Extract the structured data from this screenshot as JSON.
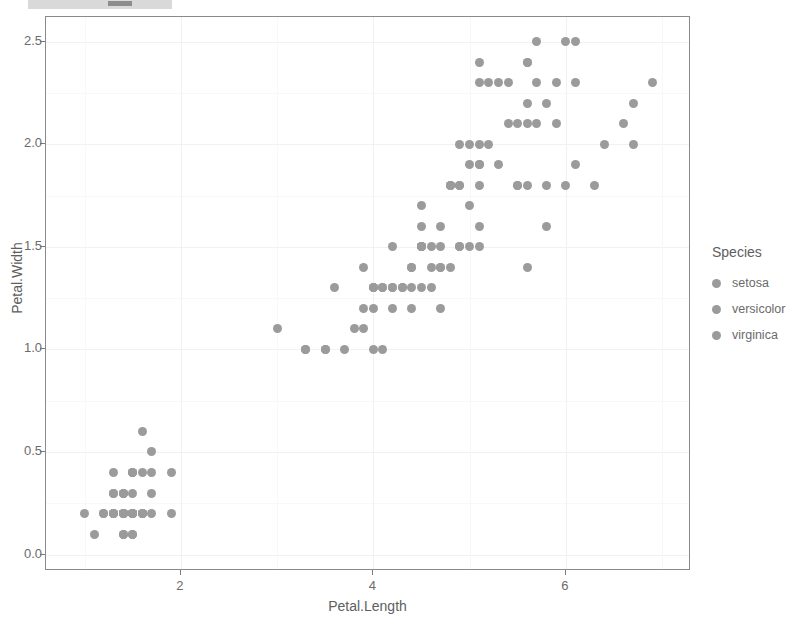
{
  "toolbar": {
    "present": true,
    "segment_label": ""
  },
  "chart_data": {
    "type": "scatter",
    "title": "",
    "xlabel": "Petal.Length",
    "ylabel": "Petal.Width",
    "xlim": [
      0.6,
      7.3
    ],
    "ylim": [
      -0.08,
      2.62
    ],
    "xticks": [
      2,
      4,
      6
    ],
    "xticklabels": [
      "2",
      "4",
      "6"
    ],
    "yticks": [
      0.0,
      0.5,
      1.0,
      1.5,
      2.0,
      2.5
    ],
    "yticklabels": [
      "0.0",
      "0.5",
      "1.0",
      "1.5",
      "2.0",
      "2.5"
    ],
    "grid": true,
    "legend": {
      "title": "Species",
      "position": "right",
      "entries": [
        {
          "label": "setosa",
          "color": "#9b9b9b"
        },
        {
          "label": "versicolor",
          "color": "#9b9b9b"
        },
        {
          "label": "virginica",
          "color": "#9b9b9b"
        }
      ]
    },
    "point_color": "#9b9b9b",
    "point_size": 9,
    "series": [
      {
        "name": "setosa",
        "color": "#9b9b9b",
        "x": [
          1.4,
          1.4,
          1.3,
          1.5,
          1.4,
          1.7,
          1.4,
          1.5,
          1.4,
          1.5,
          1.5,
          1.6,
          1.4,
          1.1,
          1.2,
          1.5,
          1.3,
          1.4,
          1.7,
          1.5,
          1.7,
          1.5,
          1.0,
          1.7,
          1.9,
          1.6,
          1.6,
          1.5,
          1.4,
          1.6,
          1.6,
          1.5,
          1.5,
          1.4,
          1.5,
          1.2,
          1.3,
          1.4,
          1.3,
          1.5,
          1.3,
          1.3,
          1.3,
          1.6,
          1.9,
          1.4,
          1.6,
          1.4,
          1.5,
          1.4
        ],
        "y": [
          0.2,
          0.2,
          0.2,
          0.2,
          0.2,
          0.4,
          0.3,
          0.2,
          0.2,
          0.1,
          0.2,
          0.2,
          0.1,
          0.1,
          0.2,
          0.4,
          0.4,
          0.3,
          0.3,
          0.3,
          0.2,
          0.4,
          0.2,
          0.5,
          0.2,
          0.2,
          0.4,
          0.2,
          0.2,
          0.2,
          0.2,
          0.4,
          0.1,
          0.2,
          0.2,
          0.2,
          0.2,
          0.1,
          0.2,
          0.2,
          0.3,
          0.3,
          0.2,
          0.6,
          0.4,
          0.3,
          0.2,
          0.2,
          0.2,
          0.2
        ]
      },
      {
        "name": "versicolor",
        "color": "#9b9b9b",
        "x": [
          4.7,
          4.5,
          4.9,
          4.0,
          4.6,
          4.5,
          4.7,
          3.3,
          4.6,
          3.9,
          3.5,
          4.2,
          4.0,
          4.7,
          3.6,
          4.4,
          4.5,
          4.1,
          4.5,
          3.9,
          4.8,
          4.0,
          4.9,
          4.7,
          4.3,
          4.4,
          4.8,
          5.0,
          4.5,
          3.5,
          3.8,
          3.7,
          3.9,
          5.1,
          4.5,
          4.5,
          4.7,
          4.4,
          4.1,
          4.0,
          4.4,
          4.6,
          4.0,
          3.3,
          4.2,
          4.2,
          4.2,
          4.3,
          3.0,
          4.1
        ],
        "y": [
          1.4,
          1.5,
          1.5,
          1.3,
          1.5,
          1.3,
          1.6,
          1.0,
          1.3,
          1.4,
          1.0,
          1.5,
          1.0,
          1.4,
          1.3,
          1.4,
          1.5,
          1.0,
          1.5,
          1.1,
          1.8,
          1.3,
          1.5,
          1.2,
          1.3,
          1.4,
          1.4,
          1.7,
          1.5,
          1.0,
          1.1,
          1.0,
          1.2,
          1.6,
          1.5,
          1.6,
          1.5,
          1.3,
          1.3,
          1.3,
          1.2,
          1.4,
          1.2,
          1.0,
          1.3,
          1.2,
          1.3,
          1.3,
          1.1,
          1.3
        ]
      },
      {
        "name": "virginica",
        "color": "#9b9b9b",
        "x": [
          6.0,
          5.1,
          5.9,
          5.6,
          5.8,
          6.6,
          4.5,
          6.3,
          5.8,
          6.1,
          5.1,
          5.3,
          5.5,
          5.0,
          5.1,
          5.3,
          5.5,
          6.7,
          6.9,
          5.0,
          5.7,
          4.9,
          6.7,
          4.9,
          5.7,
          6.0,
          4.8,
          4.9,
          5.6,
          5.8,
          6.1,
          6.4,
          5.6,
          5.1,
          5.6,
          6.1,
          5.6,
          5.5,
          4.8,
          5.4,
          5.6,
          5.1,
          5.1,
          5.9,
          5.7,
          5.2,
          5.0,
          5.2,
          5.4,
          5.1
        ],
        "y": [
          2.5,
          1.9,
          2.1,
          1.8,
          2.2,
          2.1,
          1.7,
          1.8,
          1.8,
          2.5,
          2.0,
          1.9,
          2.1,
          2.0,
          2.4,
          2.3,
          1.8,
          2.2,
          2.3,
          1.5,
          2.3,
          2.0,
          2.0,
          1.8,
          2.1,
          1.8,
          1.8,
          1.8,
          2.1,
          1.6,
          1.9,
          2.0,
          2.2,
          1.5,
          1.4,
          2.3,
          2.4,
          1.8,
          1.8,
          2.1,
          2.4,
          2.3,
          1.9,
          2.3,
          2.5,
          2.3,
          1.9,
          2.0,
          2.3,
          1.8
        ]
      }
    ]
  }
}
